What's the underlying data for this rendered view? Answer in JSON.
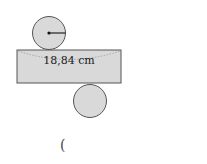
{
  "diagram": {
    "type": "cylinder-net",
    "rectangle_label": "18,84 cm",
    "parenthesis": "(",
    "colors": {
      "fill": "#d9d9d9",
      "stroke": "#555555"
    }
  }
}
